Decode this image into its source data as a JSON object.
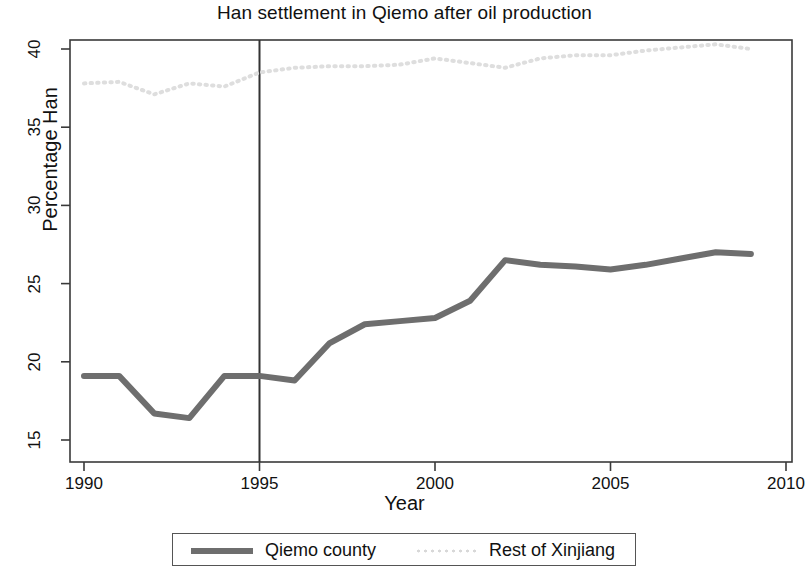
{
  "chart_data": {
    "type": "line",
    "title": "Han settlement in Qiemo after oil production",
    "xlabel": "Year",
    "ylabel": "Percentage Han",
    "xlim": [
      1990,
      2010
    ],
    "ylim": [
      13.5,
      41.5
    ],
    "xticks": [
      "1990",
      "1995",
      "2000",
      "2005",
      "2010"
    ],
    "yticks": [
      "15",
      "20",
      "25",
      "30",
      "35",
      "40"
    ],
    "grid": false,
    "legend_position": "below-axes",
    "x": [
      1990,
      1991,
      1992,
      1993,
      1994,
      1995,
      1996,
      1997,
      1998,
      1999,
      2000,
      2001,
      2002,
      2003,
      2004,
      2005,
      2006,
      2007,
      2008,
      2009
    ],
    "series": [
      {
        "name": "Qiemo county",
        "style": "solid",
        "color": "#6e6e6e",
        "values": [
          19.1,
          19.1,
          16.7,
          16.4,
          19.1,
          19.1,
          18.8,
          21.2,
          22.4,
          22.6,
          22.8,
          23.9,
          26.5,
          26.2,
          26.1,
          25.9,
          26.2,
          26.6,
          27.0,
          26.9
        ]
      },
      {
        "name": "Rest of Xinjiang",
        "style": "dotted",
        "color": "#dedede",
        "values": [
          37.8,
          37.9,
          37.1,
          37.8,
          37.6,
          38.5,
          38.8,
          38.9,
          38.9,
          39.0,
          39.4,
          39.1,
          38.8,
          39.4,
          39.6,
          39.6,
          39.9,
          40.1,
          40.3,
          40.0
        ]
      }
    ],
    "annotations": [
      {
        "type": "vline",
        "label": "oil production start",
        "x": 1995,
        "color": "#333333"
      }
    ]
  },
  "legend": {
    "entries": [
      {
        "label": "Qiemo county"
      },
      {
        "label": "Rest of Xinjiang"
      }
    ]
  },
  "axis": {
    "y_ticks": [
      "40",
      "35",
      "30",
      "25",
      "20",
      "15"
    ],
    "x_ticks": [
      "1990",
      "1995",
      "2000",
      "2005",
      "2010"
    ]
  }
}
